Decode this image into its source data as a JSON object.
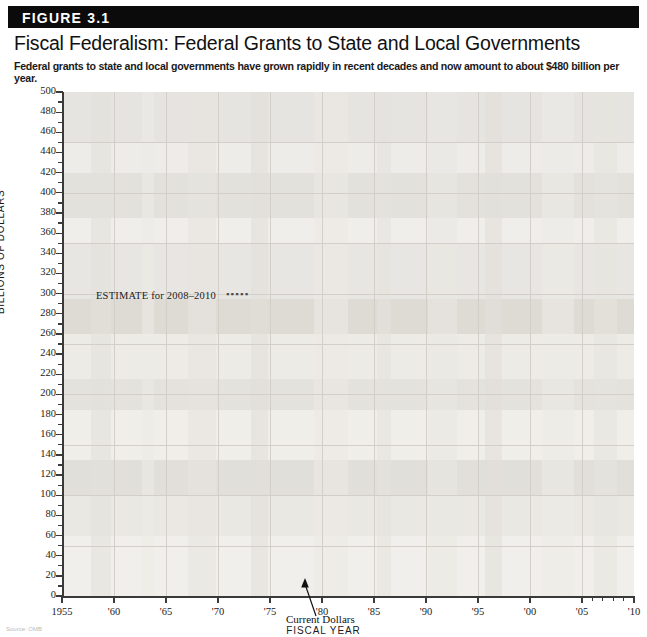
{
  "figure": {
    "badge": "FIGURE 3.1",
    "title": "Fiscal Federalism: Federal Grants to State and Local Governments",
    "subtitle": "Federal grants to state and local governments have grown rapidly in recent decades and now amount to about $480 billion per year.",
    "source_note": "Source: OMB"
  },
  "annotations": {
    "estimate_label": "ESTIMATE for 2008–2010",
    "estimate_swatch": "▪▪▪▪▪",
    "series_callout": "Current Dollars"
  },
  "axes": {
    "y_title": "BILLIONS OF DOLLARS",
    "x_title": "FISCAL YEAR",
    "y_ticks": [
      0,
      20,
      40,
      60,
      80,
      100,
      120,
      140,
      160,
      180,
      200,
      220,
      240,
      260,
      280,
      300,
      320,
      340,
      360,
      380,
      400,
      420,
      440,
      460,
      480,
      500
    ],
    "x_ticks": [
      {
        "value": 1955,
        "label": "1955"
      },
      {
        "value": 1960,
        "label": "'60"
      },
      {
        "value": 1965,
        "label": "'65"
      },
      {
        "value": 1970,
        "label": "'70"
      },
      {
        "value": 1975,
        "label": "'75"
      },
      {
        "value": 1980,
        "label": "'80"
      },
      {
        "value": 1985,
        "label": "'85"
      },
      {
        "value": 1990,
        "label": "'90"
      },
      {
        "value": 1995,
        "label": "'95"
      },
      {
        "value": 2000,
        "label": "'00"
      },
      {
        "value": 2005,
        "label": "'05"
      },
      {
        "value": 2010,
        "label": "'10"
      }
    ]
  },
  "chart_data": {
    "type": "line",
    "title": "Fiscal Federalism: Federal Grants to State and Local Governments",
    "subtitle": "Federal grants to state and local governments have grown rapidly in recent decades and now amount to about $480 billion per year.",
    "xlabel": "FISCAL YEAR",
    "ylabel": "BILLIONS OF DOLLARS",
    "xlim": [
      1955,
      2010
    ],
    "ylim": [
      0,
      500
    ],
    "grid": true,
    "legend_position": "none",
    "line_color": "#6b6b6b",
    "series": [
      {
        "name": "Current Dollars",
        "style": "solid",
        "x": [
          1955,
          1956,
          1957,
          1958,
          1959,
          1960,
          1961,
          1962,
          1963,
          1964,
          1965,
          1966,
          1967,
          1968,
          1969,
          1970,
          1971,
          1972,
          1973,
          1974,
          1975,
          1976,
          1977,
          1978,
          1979,
          1980,
          1981,
          1982,
          1983,
          1984,
          1985,
          1986,
          1987,
          1988,
          1989,
          1990,
          1991,
          1992,
          1993,
          1994,
          1995,
          1996,
          1997,
          1998,
          1999,
          2000,
          2001,
          2002,
          2003,
          2004,
          2005,
          2006,
          2007
        ],
        "values": [
          3.2,
          3.7,
          4.0,
          4.9,
          6.5,
          7.0,
          7.1,
          7.9,
          8.6,
          10.1,
          10.9,
          13.0,
          15.2,
          18.6,
          20.3,
          24.1,
          28.1,
          34.4,
          41.8,
          43.3,
          49.8,
          59.1,
          68.4,
          77.9,
          82.9,
          91.4,
          94.8,
          88.2,
          92.5,
          97.6,
          105.9,
          112.4,
          108.4,
          115.4,
          122.0,
          135.4,
          154.6,
          178.1,
          193.6,
          210.6,
          225.0,
          227.8,
          234.2,
          246.1,
          265.8,
          285.9,
          317.2,
          352.9,
          388.5,
          407.5,
          428.0,
          434.1,
          443.8
        ]
      },
      {
        "name": "Estimate 2008–2010",
        "style": "dotted",
        "x": [
          2007,
          2008,
          2009,
          2010
        ],
        "values": [
          443.8,
          455.0,
          468.0,
          480.0
        ]
      }
    ]
  }
}
